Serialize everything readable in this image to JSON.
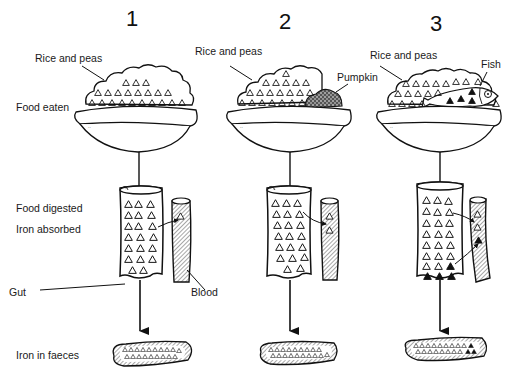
{
  "columns": [
    {
      "number": "1",
      "food_label": "Rice and peas",
      "extra_label": ""
    },
    {
      "number": "2",
      "food_label": "Rice and peas",
      "extra_label": "Pumpkin"
    },
    {
      "number": "3",
      "food_label": "Rice and peas",
      "extra_label": "Fish"
    }
  ],
  "row_labels": {
    "food_eaten": "Food eaten",
    "food_digested": "Food digested",
    "iron_absorbed": "Iron absorbed",
    "iron_in_faeces": "Iron in faeces"
  },
  "part_labels": {
    "gut": "Gut",
    "blood": "Blood"
  },
  "colors": {
    "line": "#111111",
    "background": "#ffffff"
  }
}
